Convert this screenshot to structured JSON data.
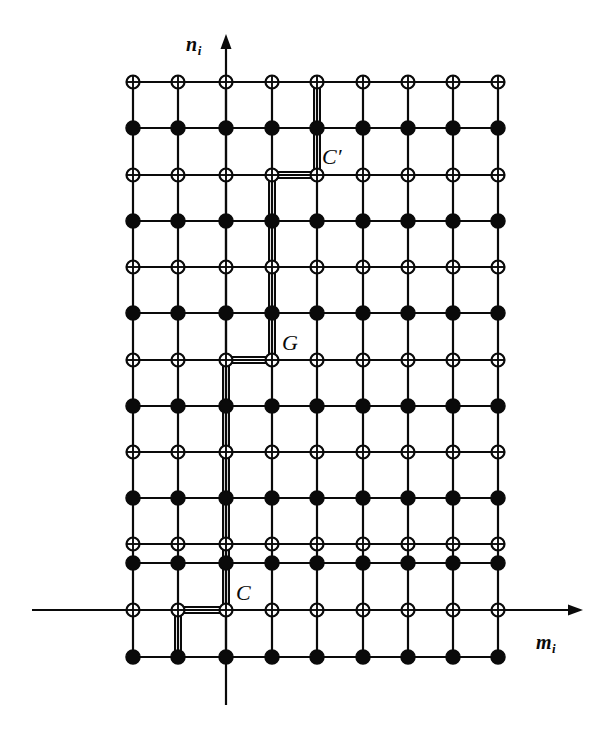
{
  "figure": {
    "kind": "lattice-diagram",
    "background_color": "#ffffff",
    "ink_color": "#0a0a0a",
    "width": 613,
    "height": 730
  },
  "axes": {
    "horizontal": {
      "name": "m-axis",
      "label": "m",
      "subscript": "i",
      "y": 610,
      "x_start": 32,
      "x_end": 583,
      "arrow": "right",
      "label_x": 536,
      "label_y": 632
    },
    "vertical": {
      "name": "n-axis",
      "label": "n",
      "subscript": "i",
      "x": 226,
      "y_start": 705,
      "y_end": 34,
      "arrow": "up",
      "label_x": 186,
      "label_y": 34
    }
  },
  "lattice": {
    "columns_x": [
      133,
      178,
      226,
      272,
      317,
      363,
      408,
      453,
      498
    ],
    "rows_y": [
      82,
      128,
      175,
      221,
      267,
      313,
      360,
      406,
      452,
      498,
      544,
      563,
      610,
      657
    ],
    "row_types": [
      "open",
      "filled",
      "open",
      "filled",
      "open",
      "filled",
      "open",
      "filled",
      "open",
      "filled",
      "open",
      "filled",
      "open",
      "filled"
    ],
    "open_marker": {
      "name": "crossed-circle-site",
      "radius": 6.5,
      "fill": "#ffffff",
      "stroke": "#0a0a0a",
      "stroke_width": 2.2,
      "has_cross": true
    },
    "filled_marker": {
      "name": "filled-circle-site",
      "radius": 7.0,
      "fill": "#0a0a0a",
      "stroke": "#0a0a0a",
      "stroke_width": 1.5,
      "has_cross": false
    },
    "grid_line_width": 2.2,
    "column_count": 9,
    "row_count": 14
  },
  "path": {
    "name": "domain-wall-path",
    "description": "doubled emphasised staircase path",
    "line_width": 2.0,
    "offset": 3.0,
    "vertices": [
      [
        317,
        78
      ],
      [
        317,
        175
      ],
      [
        272,
        175
      ],
      [
        272,
        360
      ],
      [
        226,
        360
      ],
      [
        226,
        610
      ],
      [
        178,
        610
      ],
      [
        178,
        661
      ]
    ]
  },
  "point_labels": [
    {
      "name": "label-c-prime",
      "text": "C",
      "prime": "′",
      "x": 322,
      "y": 146
    },
    {
      "name": "label-g",
      "text": "G",
      "prime": "",
      "x": 282,
      "y": 332
    },
    {
      "name": "label-c",
      "text": "C",
      "prime": "",
      "x": 236,
      "y": 582
    }
  ]
}
